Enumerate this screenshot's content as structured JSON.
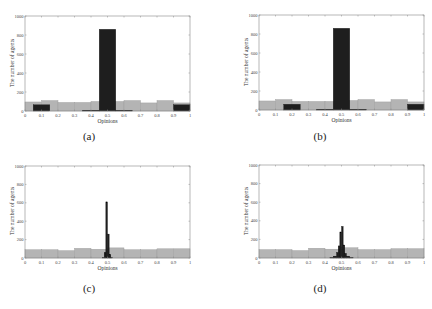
{
  "colors": {
    "gray_bar": "#b4b4b4",
    "gray_edge": "#9a9a9a",
    "dark_bar": "#1e1e1e",
    "axis": "#888888"
  },
  "chart_data": [
    {
      "id": "a",
      "caption": "(a)",
      "type": "bar",
      "xlabel": "Opinions",
      "ylabel": "The number of agents",
      "xlim": [
        0,
        1
      ],
      "ylim": [
        0,
        1000
      ],
      "xticks": [
        "0",
        "0.1",
        "0.2",
        "0.3",
        "0.4",
        "0.5",
        "0.6",
        "0.7",
        "0.8",
        "0.9",
        "1"
      ],
      "yticks": [
        "0",
        "200",
        "400",
        "600",
        "800",
        "1000"
      ],
      "series": [
        {
          "name": "initial",
          "color": "gray",
          "bins": [
            [
              0,
              0.1,
              95
            ],
            [
              0.1,
              0.2,
              110
            ],
            [
              0.2,
              0.3,
              90
            ],
            [
              0.3,
              0.4,
              90
            ],
            [
              0.4,
              0.5,
              100
            ],
            [
              0.5,
              0.6,
              100
            ],
            [
              0.6,
              0.7,
              110
            ],
            [
              0.7,
              0.8,
              85
            ],
            [
              0.8,
              0.9,
              110
            ],
            [
              0.9,
              1.0,
              85
            ]
          ]
        },
        {
          "name": "final",
          "color": "dark",
          "bins": [
            [
              0.05,
              0.15,
              65
            ],
            [
              0.35,
              0.45,
              8
            ],
            [
              0.45,
              0.55,
              860
            ],
            [
              0.55,
              0.65,
              8
            ],
            [
              0.9,
              1.0,
              65
            ]
          ]
        }
      ]
    },
    {
      "id": "b",
      "caption": "(b)",
      "type": "bar",
      "xlabel": "Opinions",
      "ylabel": "The number of agents",
      "xlim": [
        0,
        1
      ],
      "ylim": [
        0,
        1000
      ],
      "xticks": [
        "0",
        "0.1",
        "0.2",
        "0.3",
        "0.4",
        "0.5",
        "0.6",
        "0.7",
        "0.8",
        "0.9",
        "1"
      ],
      "yticks": [
        "0",
        "200",
        "400",
        "600",
        "800",
        "1000"
      ],
      "series": [
        {
          "name": "initial",
          "color": "gray",
          "bins": [
            [
              0,
              0.1,
              95
            ],
            [
              0.1,
              0.2,
              110
            ],
            [
              0.2,
              0.3,
              90
            ],
            [
              0.3,
              0.4,
              90
            ],
            [
              0.4,
              0.5,
              90
            ],
            [
              0.5,
              0.6,
              100
            ],
            [
              0.6,
              0.7,
              110
            ],
            [
              0.7,
              0.8,
              85
            ],
            [
              0.8,
              0.9,
              110
            ],
            [
              0.9,
              1.0,
              85
            ]
          ]
        },
        {
          "name": "final",
          "color": "dark",
          "bins": [
            [
              0.15,
              0.25,
              60
            ],
            [
              0.35,
              0.45,
              8
            ],
            [
              0.45,
              0.55,
              860
            ],
            [
              0.55,
              0.65,
              8
            ],
            [
              0.9,
              1.0,
              60
            ]
          ]
        }
      ]
    },
    {
      "id": "c",
      "caption": "(c)",
      "type": "bar",
      "xlabel": "Opinions",
      "ylabel": "The number of agents",
      "xlim": [
        0,
        1
      ],
      "ylim": [
        0,
        1000
      ],
      "xticks": [
        "0",
        "0.1",
        "0.2",
        "0.3",
        "0.4",
        "0.5",
        "0.6",
        "0.7",
        "0.8",
        "0.9",
        "1"
      ],
      "yticks": [
        "0",
        "200",
        "400",
        "600",
        "800",
        "1000"
      ],
      "series": [
        {
          "name": "initial",
          "color": "gray",
          "bins": [
            [
              0,
              0.1,
              90
            ],
            [
              0.1,
              0.2,
              90
            ],
            [
              0.2,
              0.3,
              80
            ],
            [
              0.3,
              0.4,
              105
            ],
            [
              0.4,
              0.5,
              95
            ],
            [
              0.5,
              0.6,
              110
            ],
            [
              0.6,
              0.7,
              90
            ],
            [
              0.7,
              0.8,
              90
            ],
            [
              0.8,
              0.9,
              100
            ],
            [
              0.9,
              1.0,
              100
            ]
          ]
        },
        {
          "name": "final",
          "color": "dark",
          "bins": [
            [
              0.47,
              0.48,
              5
            ],
            [
              0.48,
              0.49,
              60
            ],
            [
              0.49,
              0.5,
              610
            ],
            [
              0.5,
              0.51,
              260
            ],
            [
              0.51,
              0.52,
              40
            ],
            [
              0.52,
              0.53,
              5
            ]
          ]
        }
      ]
    },
    {
      "id": "d",
      "caption": "(d)",
      "type": "bar",
      "xlabel": "Opinions",
      "ylabel": "The number of agents",
      "xlim": [
        0,
        1
      ],
      "ylim": [
        0,
        1000
      ],
      "xticks": [
        "0",
        "0.1",
        "0.2",
        "0.3",
        "0.4",
        "0.5",
        "0.6",
        "0.7",
        "0.8",
        "0.9",
        "1"
      ],
      "yticks": [
        "0",
        "200",
        "400",
        "600",
        "800",
        "1000"
      ],
      "series": [
        {
          "name": "initial",
          "color": "gray",
          "bins": [
            [
              0,
              0.1,
              90
            ],
            [
              0.1,
              0.2,
              90
            ],
            [
              0.2,
              0.3,
              80
            ],
            [
              0.3,
              0.4,
              105
            ],
            [
              0.4,
              0.5,
              95
            ],
            [
              0.5,
              0.6,
              110
            ],
            [
              0.6,
              0.7,
              90
            ],
            [
              0.7,
              0.8,
              90
            ],
            [
              0.8,
              0.9,
              100
            ],
            [
              0.9,
              1.0,
              100
            ]
          ]
        },
        {
          "name": "final",
          "color": "dark",
          "bins": [
            [
              0.43,
              0.45,
              5
            ],
            [
              0.45,
              0.47,
              20
            ],
            [
              0.47,
              0.48,
              60
            ],
            [
              0.48,
              0.49,
              130
            ],
            [
              0.49,
              0.5,
              280
            ],
            [
              0.5,
              0.51,
              340
            ],
            [
              0.51,
              0.52,
              140
            ],
            [
              0.52,
              0.53,
              50
            ],
            [
              0.53,
              0.55,
              20
            ],
            [
              0.55,
              0.57,
              5
            ]
          ]
        }
      ]
    }
  ],
  "layout": {
    "panels": [
      {
        "left": 0,
        "top": 0,
        "plot": [
          25,
          16,
          190,
          111
        ],
        "caption_xy": [
          89,
          138
        ]
      },
      {
        "left": 216,
        "top": 0,
        "plot": [
          43,
          15,
          208,
          110
        ],
        "caption_xy": [
          104,
          138
        ]
      },
      {
        "left": 0,
        "top": 154,
        "plot": [
          25,
          12,
          190,
          104
        ],
        "caption_xy": [
          89,
          136
        ]
      },
      {
        "left": 216,
        "top": 154,
        "plot": [
          43,
          11,
          208,
          104
        ],
        "caption_xy": [
          104,
          136
        ]
      }
    ]
  }
}
